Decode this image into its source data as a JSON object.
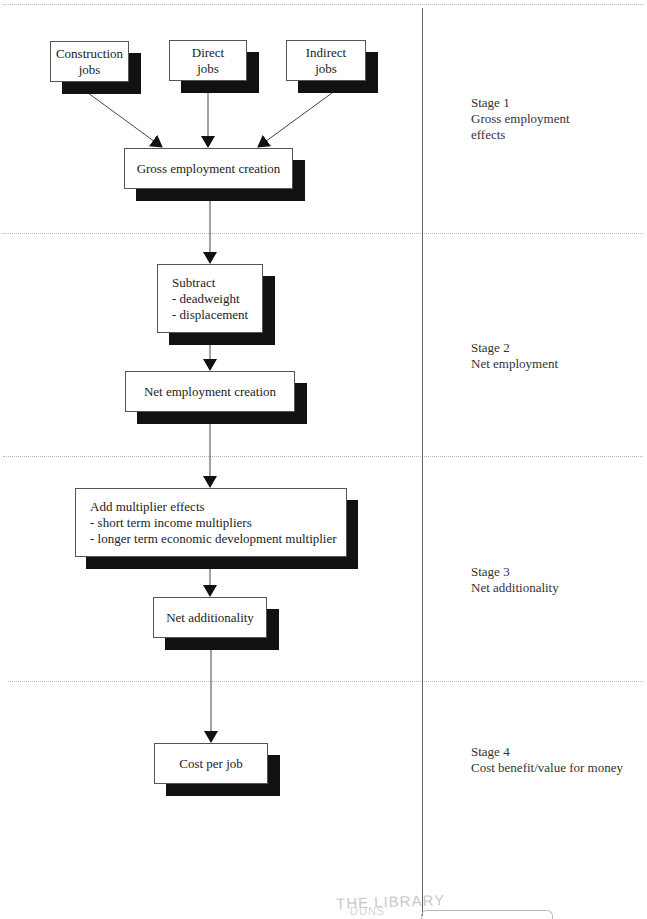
{
  "diagram": {
    "nodes": {
      "construction_jobs": {
        "lines": [
          "Construction",
          "jobs"
        ]
      },
      "direct_jobs": {
        "lines": [
          "Direct",
          "jobs"
        ]
      },
      "indirect_jobs": {
        "lines": [
          "Indirect",
          "jobs"
        ]
      },
      "gross_employment": {
        "lines": [
          "Gross employment creation"
        ]
      },
      "subtract": {
        "lines": [
          "Subtract",
          "- deadweight",
          "- displacement"
        ]
      },
      "net_employment": {
        "lines": [
          "Net employment creation"
        ]
      },
      "add_multiplier": {
        "lines": [
          "Add multiplier effects",
          "- short term income multipliers",
          "- longer term economic development multiplier"
        ]
      },
      "net_additionality": {
        "lines": [
          "Net additionality"
        ]
      },
      "cost_per_job": {
        "lines": [
          "Cost per job"
        ]
      }
    },
    "edges": [
      {
        "from": "construction_jobs",
        "to": "gross_employment"
      },
      {
        "from": "direct_jobs",
        "to": "gross_employment"
      },
      {
        "from": "indirect_jobs",
        "to": "gross_employment"
      },
      {
        "from": "gross_employment",
        "to": "subtract"
      },
      {
        "from": "subtract",
        "to": "net_employment"
      },
      {
        "from": "net_employment",
        "to": "add_multiplier"
      },
      {
        "from": "add_multiplier",
        "to": "net_additionality"
      },
      {
        "from": "net_additionality",
        "to": "cost_per_job"
      }
    ],
    "stages": [
      {
        "title": "Stage 1",
        "lines": [
          "Gross employment",
          "effects"
        ]
      },
      {
        "title": "Stage 2",
        "lines": [
          "Net employment"
        ]
      },
      {
        "title": "Stage 3",
        "lines": [
          "Net additionality"
        ]
      },
      {
        "title": "Stage 4",
        "lines": [
          "Cost benefit/value for money"
        ]
      }
    ]
  },
  "stamp": {
    "text": "THE LIBRARY",
    "partial_text": "DUNS"
  }
}
